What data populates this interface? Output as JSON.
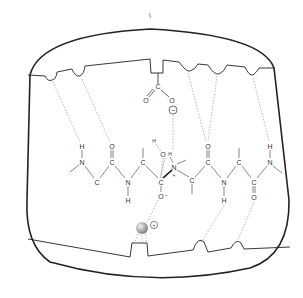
{
  "diagram": {
    "top_mark": "\\",
    "carboxylate": {
      "C": "C",
      "O1": "O",
      "O2": "O",
      "charge": "−"
    },
    "chain_atoms": [
      {
        "id": "N1",
        "label": "N",
        "x": 82,
        "y": 162
      },
      {
        "id": "H1",
        "label": "H",
        "x": 82,
        "y": 146
      },
      {
        "id": "C1",
        "label": "C",
        "x": 97,
        "y": 182
      },
      {
        "id": "C2",
        "label": "C",
        "x": 112,
        "y": 162
      },
      {
        "id": "O2",
        "label": "O",
        "x": 112,
        "y": 146
      },
      {
        "id": "N2",
        "label": "N",
        "x": 128,
        "y": 182
      },
      {
        "id": "H2",
        "label": "H",
        "x": 128,
        "y": 200
      },
      {
        "id": "C3",
        "label": "C",
        "x": 143,
        "y": 162
      },
      {
        "id": "C4",
        "label": "C",
        "x": 161,
        "y": 182
      },
      {
        "id": "Om",
        "label": "O⁻",
        "x": 161,
        "y": 196
      },
      {
        "id": "OH",
        "label": "O",
        "x": 163,
        "y": 154
      },
      {
        "id": "HO",
        "label": "H",
        "x": 154,
        "y": 141
      },
      {
        "id": "Np",
        "label": "N",
        "x": 174,
        "y": 167
      },
      {
        "id": "HN",
        "label": "H",
        "x": 170,
        "y": 154
      },
      {
        "id": "Ce",
        "label": "C",
        "x": 192,
        "y": 180
      },
      {
        "id": "C6",
        "label": "C",
        "x": 208,
        "y": 162
      },
      {
        "id": "O6",
        "label": "O",
        "x": 208,
        "y": 146
      },
      {
        "id": "N6",
        "label": "N",
        "x": 224,
        "y": 182
      },
      {
        "id": "H6",
        "label": "H",
        "x": 224,
        "y": 200
      },
      {
        "id": "C7",
        "label": "C",
        "x": 239,
        "y": 162
      },
      {
        "id": "C8",
        "label": "C",
        "x": 254,
        "y": 182
      },
      {
        "id": "O8",
        "label": "O",
        "x": 254,
        "y": 197
      },
      {
        "id": "N9",
        "label": "N",
        "x": 270,
        "y": 162
      },
      {
        "id": "H9",
        "label": "H",
        "x": 270,
        "y": 146
      }
    ],
    "charges": {
      "nitrogen_plus": "+",
      "metal_plus": "+",
      "carboxylate_minus": "−",
      "oxygen_minus": "−"
    },
    "colors": {
      "line": "#222222",
      "dashed": "#888888",
      "metal_ball": "#9a9a9a",
      "background": "#ffffff"
    }
  }
}
